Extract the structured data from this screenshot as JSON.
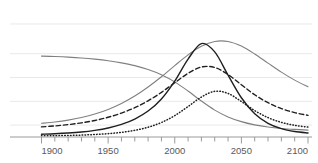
{
  "chart_data": {
    "type": "line",
    "title": "",
    "subtitle": "",
    "xlabel": "",
    "ylabel": "",
    "xlim": [
      1900,
      2100
    ],
    "ylim": [
      0,
      100
    ],
    "grid": "horizontal",
    "gridline_values": [
      10,
      30,
      50,
      70,
      95
    ],
    "legend": "none",
    "x_tick_labels": [
      "1900",
      "1950",
      "2000",
      "2050",
      "2100"
    ],
    "x_tick_values": [
      1900,
      1950,
      2000,
      2050,
      2100
    ],
    "x_minor_tick_step": 10,
    "y_tick_labels": [],
    "colors": {
      "dark": "#1f1f1f",
      "gray": "#808083",
      "gridline": "#e9e9ec",
      "axis": "#9a9a9d",
      "tick_text": "#59595b"
    },
    "x": [
      1900,
      1910,
      1920,
      1930,
      1940,
      1950,
      1960,
      1970,
      1980,
      1990,
      2000,
      2010,
      2020,
      2030,
      2040,
      2050,
      2060,
      2070,
      2080,
      2090,
      2100
    ],
    "series": [
      {
        "name": "declining-gray-curve",
        "style": "solid",
        "color": "#808083",
        "width": 1.1,
        "values": [
          68,
          67.6,
          67.1,
          66.4,
          65.4,
          64.1,
          62.3,
          60.0,
          56.8,
          52.4,
          46.3,
          38.6,
          30.2,
          22.6,
          16.9,
          12.9,
          10.2,
          8.4,
          7.2,
          6.4,
          5.8
        ]
      },
      {
        "name": "late-peak-gray-curve",
        "style": "solid",
        "color": "#808083",
        "width": 1.1,
        "values": [
          11.5,
          12.6,
          14.2,
          16.4,
          19.3,
          23.2,
          28.2,
          34.4,
          42.0,
          50.6,
          60.0,
          69.0,
          76.2,
          80.3,
          80.3,
          76.4,
          69.8,
          62.1,
          54.5,
          47.8,
          42.3
        ]
      },
      {
        "name": "dashed-peak-curve",
        "style": "dashed",
        "color": "#1f1f1f",
        "width": 1.4,
        "values": [
          8.5,
          9.3,
          10.4,
          11.9,
          13.9,
          16.6,
          20.1,
          24.6,
          30.4,
          37.5,
          45.6,
          53.5,
          58.8,
          58.4,
          52.5,
          43.9,
          35.5,
          28.8,
          23.9,
          20.5,
          18.2
        ]
      },
      {
        "name": "sharp-peak-black-curve",
        "style": "solid",
        "color": "#1f1f1f",
        "width": 1.4,
        "values": [
          2.3,
          2.7,
          3.3,
          4.2,
          5.6,
          7.6,
          10.6,
          15.1,
          21.8,
          32.0,
          47.0,
          65.5,
          78.5,
          71.5,
          52.0,
          33.0,
          19.5,
          11.5,
          7.0,
          4.6,
          3.4
        ]
      },
      {
        "name": "dotted-late-peak-curve",
        "style": "dotted",
        "color": "#1f1f1f",
        "width": 1.5,
        "values": [
          1.0,
          1.1,
          1.3,
          1.6,
          2.1,
          2.8,
          3.9,
          5.6,
          8.2,
          12.2,
          18.0,
          25.6,
          33.6,
          38.4,
          36.6,
          29.8,
          22.2,
          16.3,
          12.3,
          9.8,
          8.3
        ]
      }
    ]
  },
  "axis": {
    "tick_labels": [
      {
        "text": "1900",
        "value": 1900
      },
      {
        "text": "1950",
        "value": 1950
      },
      {
        "text": "2000",
        "value": 2000
      },
      {
        "text": "2050",
        "value": 2050
      },
      {
        "text": "2100",
        "value": 2100
      }
    ]
  }
}
